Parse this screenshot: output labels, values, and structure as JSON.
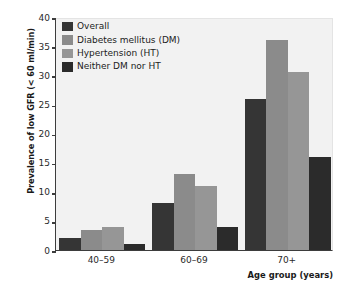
{
  "chart_data": {
    "type": "bar",
    "title": "",
    "xlabel": "Age group (years)",
    "ylabel": "Prevalence of low GFR (< 60 ml/min)",
    "categories": [
      "40–59",
      "60–69",
      "70+"
    ],
    "series": [
      {
        "name": "Overall",
        "color": "#353535",
        "values": [
          2,
          8,
          26
        ]
      },
      {
        "name": "Diabetes mellitus (DM)",
        "color": "#8b8b8b",
        "values": [
          3.5,
          13,
          36
        ]
      },
      {
        "name": "Hypertension (HT)",
        "color": "#969696",
        "values": [
          4,
          11,
          30.5
        ]
      },
      {
        "name": "Neither DM nor HT",
        "color": "#2b2b2b",
        "values": [
          1,
          4,
          16
        ]
      }
    ],
    "ylim": [
      0,
      40
    ],
    "yticks": [
      0,
      5,
      10,
      15,
      20,
      25,
      30,
      35,
      40
    ],
    "ytick_labels": [
      "0",
      "5",
      "10",
      "15",
      "20",
      "25",
      "30",
      "35",
      "40"
    ],
    "grid": false,
    "legend_position": "top-left",
    "plot_background": "#f2f2f2",
    "axis_color": "#3d3d3d"
  }
}
